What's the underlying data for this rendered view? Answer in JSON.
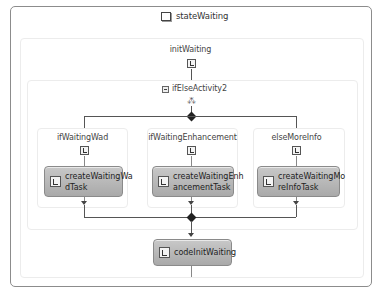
{
  "state": {
    "title": "stateWaiting",
    "icon": "state-icon"
  },
  "sequence": {
    "title": "initWaiting",
    "icon": "event-driven-icon"
  },
  "ifelse": {
    "title": "ifElseActivity2",
    "icon": "ifelse-icon",
    "collapse_icon": "collapse-icon",
    "glyph": "⁂"
  },
  "branches": [
    {
      "title": "ifWaitingWad",
      "activity": {
        "label_line1": "createWaitingWa",
        "label_line2": "dTask"
      }
    },
    {
      "title": "ifWaitingEnhancement",
      "activity": {
        "label_line1": "createWaitingEnh",
        "label_line2": "ancementTask"
      }
    },
    {
      "title": "elseMoreInfo",
      "activity": {
        "label_line1": "createWaitingMo",
        "label_line2": "reInfoTask"
      }
    }
  ],
  "code_activity": {
    "label": "codeInitWaiting",
    "icon": "code-icon"
  },
  "colors": {
    "activity_gradient_top": "#c8c8c8",
    "activity_gradient_bottom": "#a9a9a9",
    "connector": "#555555",
    "outer_border": "#8c8c8c"
  }
}
